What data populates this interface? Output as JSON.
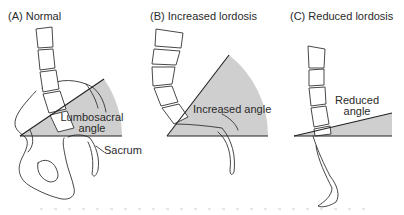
{
  "panels": [
    {
      "id": "A",
      "title": "(A) Normal",
      "labels": {
        "angle": "Lumbosacral\nangle",
        "angle_line1": "Lumbosacral",
        "angle_line2": "angle",
        "sacrum": "Sacrum"
      },
      "angle_degrees_approx": 40
    },
    {
      "id": "B",
      "title": "(B) Increased lordosis",
      "labels": {
        "angle": "Increased angle"
      },
      "angle_degrees_approx": 55
    },
    {
      "id": "C",
      "title": "(C) Reduced lordosis",
      "labels": {
        "angle_line1": "Reduced",
        "angle_line2": "angle"
      },
      "angle_degrees_approx": 15
    }
  ],
  "colors": {
    "wedge": "#cfcfcf",
    "line": "#333333",
    "background": "#ffffff"
  }
}
